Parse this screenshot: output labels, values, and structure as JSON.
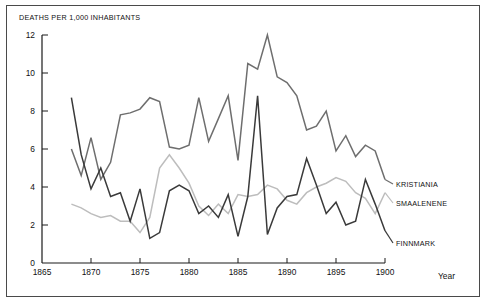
{
  "chart_data": {
    "type": "line",
    "title": "DEATHS PER 1,000 INHABITANTS",
    "xlabel": "Year",
    "ylabel": "",
    "xlim": [
      1865,
      1900
    ],
    "ylim": [
      0,
      12
    ],
    "xticks": [
      1865,
      1870,
      1875,
      1880,
      1885,
      1890,
      1895,
      1900
    ],
    "yticks": [
      0,
      2,
      4,
      6,
      8,
      10,
      12
    ],
    "grid": false,
    "legend_position": "right-inline",
    "x": [
      1868,
      1869,
      1870,
      1871,
      1872,
      1873,
      1874,
      1875,
      1876,
      1877,
      1878,
      1879,
      1880,
      1881,
      1882,
      1883,
      1884,
      1885,
      1886,
      1887,
      1888,
      1889,
      1890,
      1891,
      1892,
      1893,
      1894,
      1895,
      1896,
      1897,
      1898,
      1899,
      1900
    ],
    "series": [
      {
        "name": "KRISTIANIA",
        "color": "#6e6e6e",
        "values": [
          6.0,
          4.6,
          6.6,
          4.4,
          5.3,
          7.8,
          7.9,
          8.1,
          8.7,
          8.5,
          6.1,
          6.0,
          6.2,
          8.7,
          6.4,
          7.6,
          8.8,
          5.4,
          10.5,
          10.2,
          12.0,
          9.8,
          9.5,
          8.8,
          7.0,
          7.2,
          8.0,
          5.9,
          6.7,
          5.6,
          6.2,
          5.9,
          4.4
        ]
      },
      {
        "name": "SMAALENENE",
        "color": "#bdbdbd",
        "values": [
          3.1,
          2.9,
          2.6,
          2.4,
          2.5,
          2.2,
          2.2,
          1.6,
          2.4,
          5.0,
          5.7,
          5.0,
          4.2,
          3.0,
          2.5,
          3.1,
          2.6,
          3.6,
          3.5,
          3.6,
          4.1,
          3.9,
          3.3,
          3.1,
          3.7,
          4.0,
          4.2,
          4.5,
          4.3,
          3.7,
          3.4,
          2.6,
          3.7
        ]
      },
      {
        "name": "FINNMARK",
        "color": "#3a3a3a",
        "values": [
          8.7,
          5.7,
          3.9,
          5.0,
          3.5,
          3.7,
          2.2,
          3.9,
          1.3,
          1.6,
          3.8,
          4.1,
          3.8,
          2.6,
          3.0,
          2.4,
          3.6,
          1.4,
          3.5,
          8.8,
          1.5,
          2.9,
          3.5,
          3.6,
          5.5,
          4.1,
          2.6,
          3.2,
          2.0,
          2.2,
          4.4,
          3.1,
          1.7
        ]
      }
    ]
  },
  "legend": [
    {
      "label": "KRISTIANIA"
    },
    {
      "label": "SMAALENENE"
    },
    {
      "label": "FINNMARK"
    }
  ]
}
